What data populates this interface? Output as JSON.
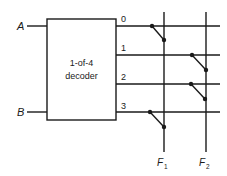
{
  "diagram": {
    "decoder": {
      "line1": "1-of-4",
      "line2": "decoder"
    },
    "inputs": [
      {
        "label": "A"
      },
      {
        "label": "B"
      }
    ],
    "outputs": [
      {
        "label": "0"
      },
      {
        "label": "1"
      },
      {
        "label": "2"
      },
      {
        "label": "3"
      }
    ],
    "function_outputs": [
      {
        "label": "F",
        "subscript": "1"
      },
      {
        "label": "F",
        "subscript": "2"
      }
    ],
    "connections": [
      {
        "output": "0",
        "to": "F1"
      },
      {
        "output": "1",
        "to": "F2"
      },
      {
        "output": "2",
        "to": "F2"
      },
      {
        "output": "3",
        "to": "F1"
      }
    ],
    "colors": {
      "line": "#1a1a1a",
      "background": "#ffffff"
    }
  }
}
